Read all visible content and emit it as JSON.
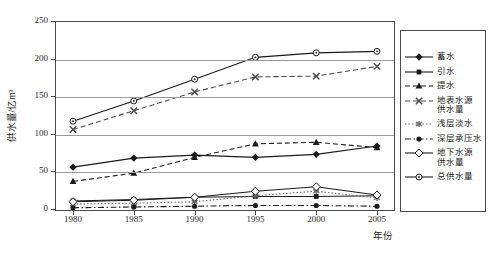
{
  "chart_data": {
    "type": "line",
    "title": "",
    "xlabel": "年份",
    "ylabel": "供水量/亿m³",
    "x": [
      1980,
      1985,
      1990,
      1995,
      2000,
      2005
    ],
    "categories": [
      "1980",
      "1985",
      "1990",
      "1995",
      "2000",
      "2005"
    ],
    "xtick_labels": [
      "1980",
      "1985",
      "1990",
      "1995",
      "2000",
      "2005"
    ],
    "ytick_labels": [
      "0",
      "50",
      "100",
      "150",
      "200",
      "250"
    ],
    "yticks": [
      0,
      50,
      100,
      150,
      200,
      250
    ],
    "ylim": [
      0,
      250
    ],
    "xlim": [
      1978,
      2007
    ],
    "grid": "horizontal",
    "legend_position": "right",
    "series": [
      {
        "name": "蓄水",
        "legend_label": "蓄水",
        "marker": "filled-diamond",
        "line_style": "solid",
        "color": "#1a1a1a",
        "values": [
          57,
          69,
          73,
          70,
          74,
          85
        ]
      },
      {
        "name": "引水",
        "legend_label": "引水",
        "marker": "filled-square",
        "line_style": "solid",
        "color": "#1a1a1a",
        "values": [
          12,
          14,
          17,
          18,
          18,
          19
        ]
      },
      {
        "name": "提水",
        "legend_label": "提水",
        "marker": "filled-triangle",
        "line_style": "dashed",
        "color": "#1a1a1a",
        "values": [
          38,
          49,
          70,
          88,
          90,
          83
        ]
      },
      {
        "name": "地表水源供水量",
        "legend_label": "地表水源\n供水量",
        "marker": "cross-x",
        "line_style": "dashed",
        "color": "#4a4a4a",
        "values": [
          107,
          132,
          157,
          177,
          178,
          191
        ]
      },
      {
        "name": "浅层淡水",
        "legend_label": "浅层淡水",
        "marker": "asterisk",
        "line_style": "dotted",
        "color": "#6a6a6a",
        "values": [
          8,
          9,
          11,
          19,
          25,
          16
        ]
      },
      {
        "name": "深层承压水",
        "legend_label": "深层承压水",
        "marker": "filled-circle",
        "line_style": "dash-dot",
        "color": "#1a1a1a",
        "values": [
          3,
          4,
          5,
          6,
          6,
          5
        ]
      },
      {
        "name": "地下水源供水量",
        "legend_label": "地下水源\n供水量",
        "marker": "open-diamond",
        "line_style": "solid",
        "color": "#1a1a1a",
        "values": [
          11,
          13,
          17,
          25,
          31,
          20
        ]
      },
      {
        "name": "总供水量",
        "legend_label": "总供水量",
        "marker": "open-circle-dot",
        "line_style": "solid",
        "color": "#1a1a1a",
        "values": [
          118,
          145,
          174,
          203,
          209,
          211
        ]
      }
    ]
  }
}
